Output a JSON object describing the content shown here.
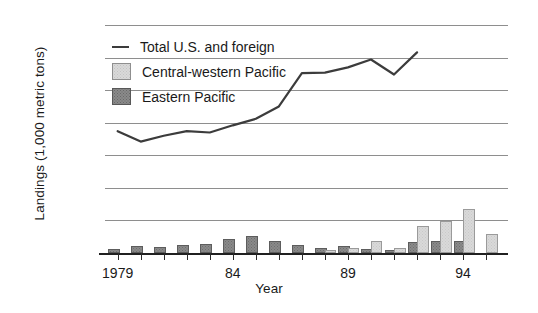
{
  "chart_data": {
    "type": "bar",
    "title": "",
    "xlabel": "Year",
    "ylabel": "Landings (1,000 metric tons)",
    "ylim": [
      0,
      35
    ],
    "yticks": [
      0,
      5,
      10,
      15,
      20,
      25,
      30,
      35
    ],
    "ytick_labels": [
      "0",
      "5",
      "10",
      "15",
      "20",
      "25",
      "30",
      "35"
    ],
    "grid": true,
    "legend_position": "upper-left",
    "x": [
      1979,
      1980,
      1981,
      1982,
      1983,
      1984,
      1985,
      1986,
      1987,
      1988,
      1989,
      1990,
      1991,
      1992,
      1993,
      1994,
      1995
    ],
    "categories": [
      "1979",
      "1980",
      "1981",
      "1982",
      "1983",
      "1984",
      "1985",
      "1986",
      "1987",
      "1988",
      "1989",
      "1990",
      "1991",
      "1992",
      "1993",
      "1994",
      "1995"
    ],
    "xtick_labels": [
      {
        "value": 1979,
        "label": "1979"
      },
      {
        "value": 1984,
        "label": "84"
      },
      {
        "value": 1989,
        "label": "89"
      },
      {
        "value": 1994,
        "label": "94"
      }
    ],
    "series": [
      {
        "name": "Total U.S. and foreign",
        "type": "line",
        "color": "#3c3c3c",
        "values": [
          18.7,
          17.1,
          18.0,
          18.7,
          18.5,
          19.6,
          20.6,
          22.5,
          27.6,
          27.7,
          28.5,
          29.7,
          27.4,
          30.8,
          null,
          null,
          null
        ]
      },
      {
        "name": "Central-western Pacific",
        "type": "bar",
        "color": "#d9d9d9",
        "values": [
          0,
          0,
          0,
          0,
          0,
          0,
          0,
          0,
          0,
          0.2,
          0.5,
          1.6,
          0.4,
          3.9,
          4.6,
          6.4,
          2.6
        ]
      },
      {
        "name": "Eastern Pacific",
        "type": "bar",
        "color": "#8a8a8a",
        "values": [
          0.3,
          0.7,
          0.6,
          1.0,
          1.1,
          1.9,
          2.3,
          1.6,
          1.0,
          0.5,
          0.8,
          0.3,
          0.2,
          1.4,
          1.6,
          1.5,
          0
        ]
      }
    ]
  },
  "legend": {
    "items": [
      {
        "label": "Total U.S. and foreign",
        "swatch": "line"
      },
      {
        "label": "Central-western Pacific",
        "swatch": "cw"
      },
      {
        "label": "Eastern Pacific",
        "swatch": "ep"
      }
    ]
  },
  "axes": {
    "y_title": "Landings (1,000 metric tons)",
    "x_title": "Year"
  }
}
